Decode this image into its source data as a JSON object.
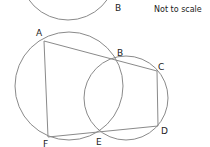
{
  "note": "Not to scale",
  "top_figure": {
    "label_b": "B"
  },
  "main_figure": {
    "labels": {
      "A": "A",
      "B": "B",
      "C": "C",
      "D": "D",
      "E": "E",
      "F": "F"
    }
  },
  "colors": {
    "stroke": "#8a8a8a",
    "text": "#222222",
    "background": "#ffffff"
  }
}
